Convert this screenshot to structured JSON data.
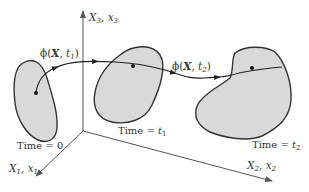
{
  "diagram": {
    "colors": {
      "body_fill": "#d9d9d9",
      "body_stroke": "#333333",
      "axis": "#555555",
      "path": "#222222",
      "background": "#ffffff"
    },
    "axes": [
      {
        "id": "x3",
        "label_main": "X",
        "label_sub1": "3",
        "sep": ", ",
        "label_alt": "x",
        "label_sub2": "3"
      },
      {
        "id": "x1",
        "label_main": "X",
        "label_sub1": "1",
        "sep": ", ",
        "label_alt": "x",
        "label_sub2": "1"
      },
      {
        "id": "x2",
        "label_main": "X",
        "label_sub1": "2",
        "sep": ", ",
        "label_alt": "x",
        "label_sub2": "2"
      }
    ],
    "bodies": [
      {
        "id": "body-t0",
        "caption_prefix": "Time = ",
        "caption_value": "0",
        "caption_sub": ""
      },
      {
        "id": "body-t1",
        "caption_prefix": "Time = ",
        "caption_value": "t",
        "caption_sub": "1"
      },
      {
        "id": "body-t2",
        "caption_prefix": "Time = ",
        "caption_value": "t",
        "caption_sub": "2"
      }
    ],
    "mappings": [
      {
        "id": "phi-t1",
        "func": "ϕ(",
        "arg_bold": "X",
        "sep": ", ",
        "time": "t",
        "time_sub": "1",
        "close": ")"
      },
      {
        "id": "phi-t2",
        "func": "ϕ(",
        "arg_bold": "X",
        "sep": ", ",
        "time": "t",
        "time_sub": "2",
        "close": ")"
      }
    ]
  }
}
